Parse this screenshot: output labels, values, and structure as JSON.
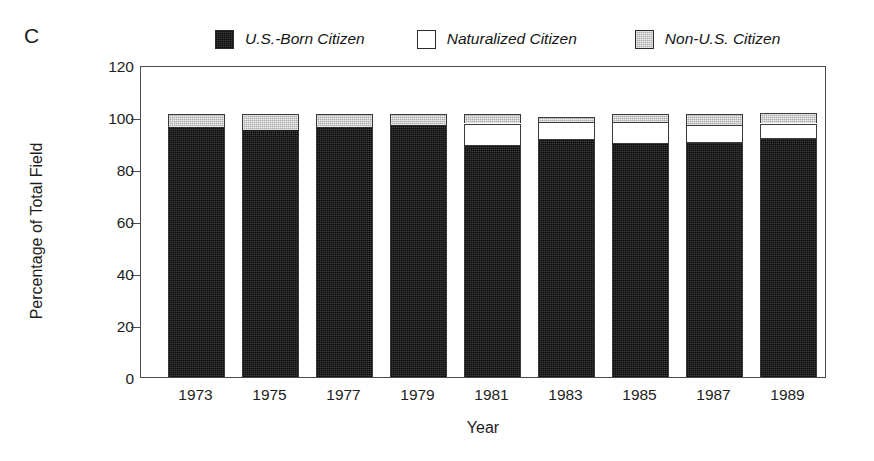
{
  "panel": {
    "label": "C"
  },
  "legend": {
    "position": "top-center",
    "items": [
      {
        "label": "U.S.-Born Citizen",
        "swatch": "dark",
        "color": "#3c3c3c"
      },
      {
        "label": "Naturalized Citizen",
        "swatch": "white",
        "color": "#ffffff"
      },
      {
        "label": "Non-U.S. Citizen",
        "swatch": "gray",
        "color": "#ababab"
      }
    ]
  },
  "chart_data": {
    "type": "bar",
    "subtype": "stacked-bar",
    "title": "",
    "xlabel": "Year",
    "ylabel": "Percentage of Total Field",
    "categories": [
      "1973",
      "1975",
      "1977",
      "1979",
      "1981",
      "1983",
      "1985",
      "1987",
      "1989"
    ],
    "series": [
      {
        "name": "U.S.-Born Citizen",
        "color": "#3c3c3c",
        "values": [
          96,
          95,
          96,
          97,
          89,
          91,
          89.5,
          90,
          91.5
        ]
      },
      {
        "name": "Naturalized Citizen",
        "color": "#ffffff",
        "values": [
          0,
          0,
          0,
          0,
          8.5,
          7,
          8.5,
          7,
          6
        ]
      },
      {
        "name": "Non-U.S. Citizen",
        "color": "#ababab",
        "values": [
          5,
          6,
          5,
          4,
          3.5,
          2,
          3,
          4,
          4
        ]
      }
    ],
    "ylim": [
      0,
      120
    ],
    "yticks": [
      0,
      20,
      40,
      60,
      80,
      100,
      120
    ],
    "ytick_labels": [
      "0",
      "20",
      "40",
      "60",
      "80",
      "100",
      "120"
    ],
    "grid": false,
    "legend_position": "top-center"
  }
}
